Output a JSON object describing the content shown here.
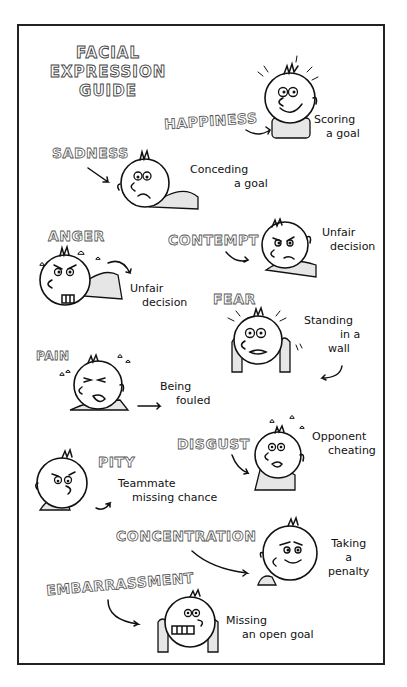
{
  "title": {
    "line1": "FACIAL",
    "line2": "EXPRESSION",
    "line3": "GUIDE"
  },
  "expressions": [
    {
      "emotion": "HAPPINESS",
      "caption_line1": "Scoring",
      "caption_line2": "a goal"
    },
    {
      "emotion": "SADNESS",
      "caption_line1": "Conceding",
      "caption_line2": "a goal"
    },
    {
      "emotion": "ANGER",
      "caption_line1": "Unfair",
      "caption_line2": "decision"
    },
    {
      "emotion": "CONTEMPT",
      "caption_line1": "Unfair",
      "caption_line2": "decision"
    },
    {
      "emotion": "FEAR",
      "caption_line1": "Standing",
      "caption_line2": "in a",
      "caption_line3": "wall"
    },
    {
      "emotion": "PAIN",
      "caption_line1": "Being",
      "caption_line2": "fouled"
    },
    {
      "emotion": "DISGUST",
      "caption_line1": "Opponent",
      "caption_line2": "cheating"
    },
    {
      "emotion": "PITY",
      "caption_line1": "Teammate",
      "caption_line2": "missing chance"
    },
    {
      "emotion": "CONCENTRATION",
      "caption_line1": "Taking",
      "caption_line2": "a",
      "caption_line3": "penalty"
    },
    {
      "emotion": "EMBARRASSMENT",
      "caption_line1": "Missing",
      "caption_line2": "an open goal"
    }
  ],
  "colors": {
    "ink": "#111111",
    "paper": "#ffffff",
    "shade": "#e6e6e6"
  }
}
